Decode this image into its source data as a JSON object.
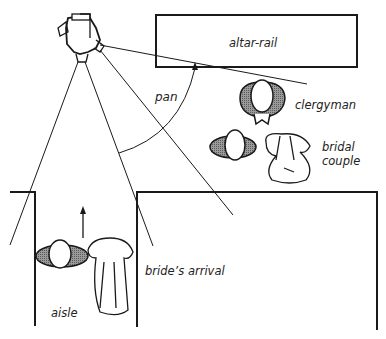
{
  "diagram": {
    "type": "wedding camera-position plan",
    "labels": {
      "altar_rail": "altar-rail",
      "pan": "pan",
      "clergyman": "clergyman",
      "bridal_couple_line1": "bridal",
      "bridal_couple_line2": "couple",
      "brides_arrival": "bride’s arrival",
      "aisle": "aisle"
    },
    "colors": {
      "ink": "#1a1a1a",
      "shade": "#8a8a8a",
      "background": "#ffffff"
    }
  }
}
